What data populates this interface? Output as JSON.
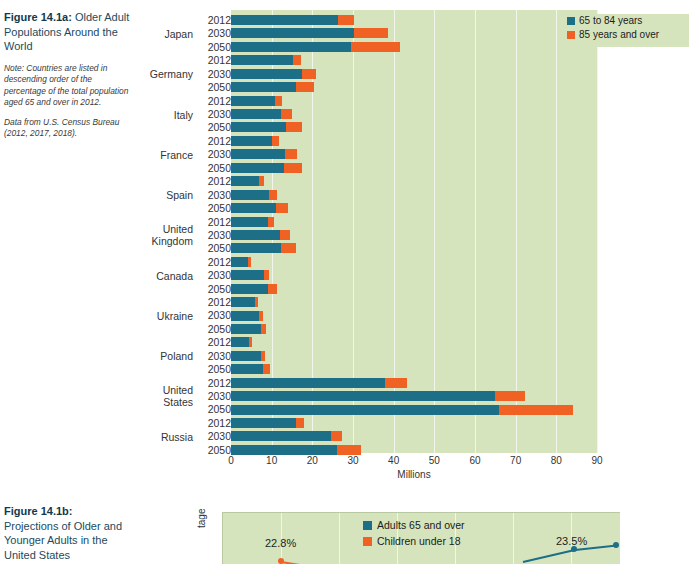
{
  "figure_a": {
    "caption": {
      "label": "Figure 14.1a:",
      "title": " Older Adult Populations Around the World",
      "note": "Note: Countries are listed in descending order of the percentage of the total population aged 65 and over in 2012.",
      "source": "Data from U.S. Census Bureau (2012, 2017, 2018)."
    },
    "legend": [
      {
        "label": "65 to 84 years",
        "color": "#1d6e87"
      },
      {
        "label": "85 years and over",
        "color": "#ef6223"
      }
    ],
    "xaxis_title": "Millions",
    "colors": {
      "series1": "#1d6e87",
      "series2": "#ef6223",
      "plot_bg": "#d6e4bd",
      "gridline": "#f2f6ea"
    }
  },
  "chart_data": {
    "type": "bar",
    "orientation": "horizontal",
    "stacked": true,
    "title": "Older Adult Populations Around the World",
    "xlabel": "Millions",
    "ylabel": "",
    "xlim": [
      0,
      90
    ],
    "xticks": [
      0,
      10,
      20,
      30,
      40,
      50,
      60,
      70,
      80,
      90
    ],
    "grid": true,
    "legend_position": "top-right",
    "series": [
      {
        "name": "65 to 84 years",
        "color": "#1d6e87"
      },
      {
        "name": "85 years and over",
        "color": "#ef6223"
      }
    ],
    "groups": [
      {
        "country": "Japan",
        "years": [
          "2012",
          "2030",
          "2050"
        ],
        "s1": [
          26.3,
          30.3,
          29.5
        ],
        "s2": [
          4.0,
          8.3,
          12.0
        ]
      },
      {
        "country": "Germany",
        "years": [
          "2012",
          "2030",
          "2050"
        ],
        "s1": [
          15.2,
          17.5,
          16.0
        ],
        "s2": [
          1.9,
          3.3,
          4.3
        ]
      },
      {
        "country": "Italy",
        "years": [
          "2012",
          "2030",
          "2050"
        ],
        "s1": [
          10.8,
          12.2,
          13.5
        ],
        "s2": [
          1.7,
          2.9,
          4.0
        ]
      },
      {
        "country": "France",
        "years": [
          "2012",
          "2030",
          "2050"
        ],
        "s1": [
          10.0,
          13.3,
          13.0
        ],
        "s2": [
          1.9,
          3.0,
          4.5
        ]
      },
      {
        "country": "Spain",
        "years": [
          "2012",
          "2030",
          "2050"
        ],
        "s1": [
          6.8,
          9.3,
          11.0
        ],
        "s2": [
          1.2,
          1.9,
          3.0
        ]
      },
      {
        "country": "United Kingdom",
        "years": [
          "2012",
          "2030",
          "2050"
        ],
        "s1": [
          9.0,
          12.0,
          12.4
        ],
        "s2": [
          1.5,
          2.4,
          3.5
        ]
      },
      {
        "country": "Canada",
        "years": [
          "2012",
          "2030",
          "2050"
        ],
        "s1": [
          4.3,
          8.2,
          9.0
        ],
        "s2": [
          0.7,
          1.2,
          2.3
        ]
      },
      {
        "country": "Ukraine",
        "years": [
          "2012",
          "2030",
          "2050"
        ],
        "s1": [
          6.0,
          7.0,
          7.3
        ],
        "s2": [
          0.6,
          0.9,
          1.4
        ]
      },
      {
        "country": "Poland",
        "years": [
          "2012",
          "2030",
          "2050"
        ],
        "s1": [
          4.5,
          7.4,
          7.8
        ],
        "s2": [
          0.6,
          0.9,
          1.9
        ]
      },
      {
        "country": "United States",
        "years": [
          "2012",
          "2030",
          "2050"
        ],
        "s1": [
          37.8,
          65.0,
          66.0
        ],
        "s2": [
          5.6,
          7.2,
          18.0
        ]
      },
      {
        "country": "Russia",
        "years": [
          "2012",
          "2030",
          "2050"
        ],
        "s1": [
          16.0,
          24.5,
          26.0
        ],
        "s2": [
          2.0,
          2.8,
          6.0
        ]
      }
    ]
  },
  "figure_b": {
    "caption": {
      "label": "Figure 14.1b:",
      "title": "Projections of Older and Younger Adults in the United States"
    },
    "ylabel": "tage",
    "legend": [
      {
        "label": "Adults 65 and over",
        "color": "#1d6e87"
      },
      {
        "label": "Children under 18",
        "color": "#ef6223"
      }
    ],
    "annotations": [
      {
        "text": "22.8%"
      },
      {
        "text": "23.5%"
      }
    ]
  }
}
